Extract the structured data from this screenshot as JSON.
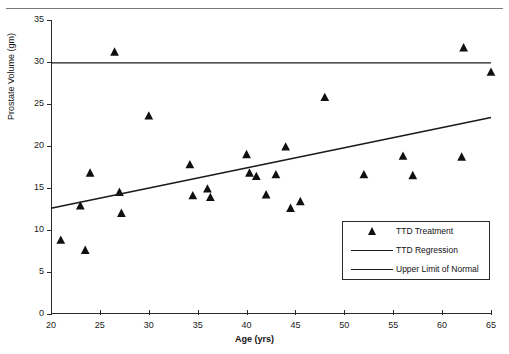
{
  "page_header": {
    "left_text": "",
    "right_text": ""
  },
  "chart_data": {
    "type": "scatter",
    "title": "",
    "xlabel": "Age (yrs)",
    "ylabel": "Prostate Volume (gm)",
    "xlim": [
      20,
      65
    ],
    "ylim": [
      0,
      35
    ],
    "xticks": [
      20,
      25,
      30,
      35,
      40,
      45,
      50,
      55,
      60,
      65
    ],
    "yticks": [
      0,
      5,
      10,
      15,
      20,
      25,
      30,
      35
    ],
    "xtick_labels": [
      "20",
      "25",
      "30",
      "35",
      "40",
      "45",
      "50",
      "55",
      "60",
      "65"
    ],
    "ytick_labels": [
      "0",
      "5",
      "10",
      "15",
      "20",
      "25",
      "30",
      "35"
    ],
    "grid": false,
    "legend_position": "lower-right",
    "series": [
      {
        "name": "TTD Treatment",
        "type": "scatter",
        "marker": "triangle",
        "color": "#101010",
        "points": [
          [
            21.0,
            8.8
          ],
          [
            23.0,
            12.9
          ],
          [
            23.5,
            7.6
          ],
          [
            24.0,
            16.8
          ],
          [
            26.5,
            31.2
          ],
          [
            27.0,
            14.5
          ],
          [
            27.2,
            12.0
          ],
          [
            30.0,
            23.6
          ],
          [
            34.2,
            17.8
          ],
          [
            34.5,
            14.1
          ],
          [
            36.0,
            14.9
          ],
          [
            36.3,
            13.9
          ],
          [
            40.0,
            19.0
          ],
          [
            40.3,
            16.8
          ],
          [
            41.0,
            16.4
          ],
          [
            42.0,
            14.2
          ],
          [
            43.0,
            16.6
          ],
          [
            44.0,
            19.9
          ],
          [
            44.5,
            12.6
          ],
          [
            45.5,
            13.4
          ],
          [
            48.0,
            25.8
          ],
          [
            52.0,
            16.6
          ],
          [
            56.0,
            18.8
          ],
          [
            57.0,
            16.5
          ],
          [
            62.0,
            18.7
          ],
          [
            62.2,
            31.7
          ],
          [
            65.0,
            28.8
          ]
        ]
      },
      {
        "name": "TTD Regression",
        "type": "line",
        "color": "#1a1a1a",
        "endpoints": [
          [
            20.0,
            12.6
          ],
          [
            65.0,
            23.4
          ]
        ]
      },
      {
        "name": "Upper Limit of Normal",
        "type": "line",
        "color": "#1a1a1a",
        "endpoints": [
          [
            20.0,
            29.9
          ],
          [
            65.0,
            29.9
          ]
        ]
      }
    ],
    "legend_entries": [
      {
        "label": "TTD Treatment",
        "key": "triangle"
      },
      {
        "label": "TTD Regression",
        "key": "line"
      },
      {
        "label": "Upper Limit of Normal",
        "key": "line"
      }
    ]
  }
}
